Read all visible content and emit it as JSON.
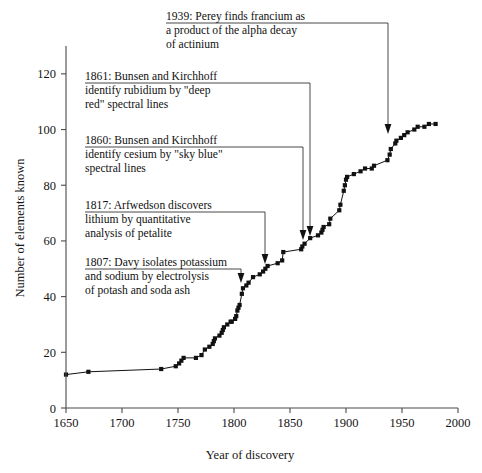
{
  "figure": {
    "title": "",
    "background_color": "#ffffff",
    "ink_color": "#111111"
  },
  "axes": {
    "x_title": "Year of discovery",
    "y_title": "Number of elements known",
    "x_ticks": [
      "1650",
      "1700",
      "1750",
      "1800",
      "1850",
      "1900",
      "1950",
      "2000"
    ],
    "y_ticks": [
      "0",
      "20",
      "40",
      "60",
      "80",
      "100",
      "120"
    ]
  },
  "annotations": [
    {
      "id": "anno-1939",
      "year": 1939,
      "lines": [
        "1939: Perey finds francium as",
        "a product of the alpha decay",
        "of actinium"
      ]
    },
    {
      "id": "anno-1861",
      "year": 1861,
      "lines": [
        "1861: Bunsen and Kirchhoff",
        "identify rubidium by \"deep",
        "red\" spectral lines"
      ]
    },
    {
      "id": "anno-1860",
      "year": 1860,
      "lines": [
        "1860: Bunsen and Kirchhoff",
        "identify cesium by \"sky blue\"",
        "spectral lines"
      ]
    },
    {
      "id": "anno-1817",
      "year": 1817,
      "lines": [
        "1817: Arfwedson discovers",
        "lithium by quantitative",
        "analysis of petalite"
      ]
    },
    {
      "id": "anno-1807",
      "year": 1807,
      "lines": [
        "1807: Davy isolates potassium",
        "and sodium by electrolysis",
        "of potash and soda ash"
      ]
    }
  ],
  "chart_data": {
    "type": "line",
    "title": "",
    "xlabel": "Year of discovery",
    "ylabel": "Number of elements known",
    "xlim": [
      1650,
      2000
    ],
    "ylim": [
      0,
      130
    ],
    "grid": false,
    "legend": "none",
    "markers": "filled-square",
    "x": [
      1650,
      1670,
      1735,
      1748,
      1751,
      1753,
      1755,
      1766,
      1771,
      1774,
      1778,
      1781,
      1782,
      1783,
      1787,
      1789,
      1790,
      1791,
      1794,
      1797,
      1798,
      1801,
      1802,
      1803,
      1804,
      1805,
      1807,
      1808,
      1811,
      1813,
      1817,
      1823,
      1826,
      1828,
      1830,
      1839,
      1843,
      1844,
      1860,
      1861,
      1863,
      1868,
      1875,
      1878,
      1879,
      1880,
      1885,
      1886,
      1894,
      1895,
      1898,
      1899,
      1900,
      1901,
      1907,
      1913,
      1917,
      1923,
      1925,
      1937,
      1939,
      1940,
      1944,
      1945,
      1949,
      1952,
      1955,
      1961,
      1964,
      1970,
      1974,
      1980
    ],
    "y": [
      12,
      13,
      14,
      15,
      16,
      17,
      18,
      18,
      19,
      21,
      22,
      23,
      24,
      25,
      26,
      27,
      28,
      29,
      30,
      31,
      31,
      32,
      33,
      35,
      36,
      37,
      41,
      43,
      44,
      45,
      47,
      48,
      49,
      50,
      51,
      52,
      53,
      56,
      57,
      58,
      59,
      61,
      62,
      63,
      64,
      65,
      66,
      68,
      71,
      73,
      78,
      80,
      82,
      83,
      84,
      85,
      86,
      86,
      87,
      89,
      91,
      93,
      95,
      96,
      97,
      98,
      99,
      100,
      101,
      101,
      102,
      102
    ],
    "series": [
      {
        "name": "Elements known",
        "values": [
          12,
          13,
          14,
          15,
          16,
          17,
          18,
          18,
          19,
          21,
          22,
          23,
          24,
          25,
          26,
          27,
          28,
          29,
          30,
          31,
          31,
          32,
          33,
          35,
          36,
          37,
          41,
          43,
          44,
          45,
          47,
          48,
          49,
          50,
          51,
          52,
          53,
          56,
          57,
          58,
          59,
          61,
          62,
          63,
          64,
          65,
          66,
          68,
          71,
          73,
          78,
          80,
          82,
          83,
          84,
          85,
          86,
          86,
          87,
          89,
          91,
          93,
          95,
          96,
          97,
          98,
          99,
          100,
          101,
          101,
          102,
          102
        ]
      }
    ]
  }
}
